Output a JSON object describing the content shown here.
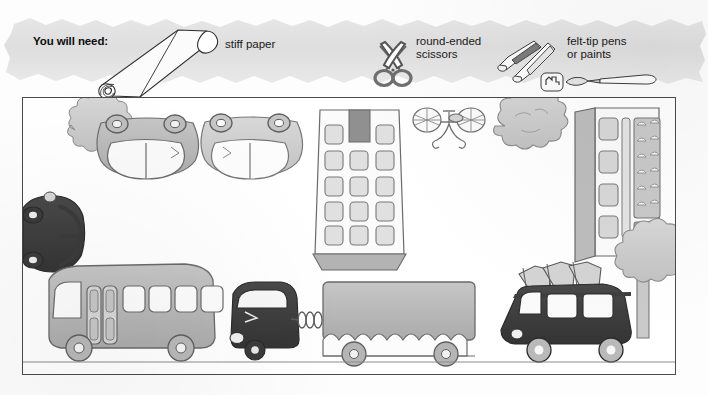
{
  "page": {
    "kind": "craft-book-scan",
    "background_color": "#ffffff"
  },
  "banner": {
    "heading": "You will need:",
    "fill_color": "#e3e3e3",
    "items": [
      {
        "label": "stiff paper",
        "icon": "paper-roll-icon"
      },
      {
        "label": "round-ended\nscissors",
        "line1": "round-ended",
        "line2": "scissors",
        "icon": "scissors-icon"
      },
      {
        "label": "felt-tip pens\nor paints",
        "line1": "felt-tip pens",
        "line2": "or paints",
        "icon": "felt-tip-pens-icon"
      }
    ]
  },
  "illustration": {
    "title": "street scene with vehicles",
    "frame_color": "#4a4a4a",
    "palette": {
      "light_gray": "#cfcfcf",
      "mid_gray": "#b5b5b5",
      "dark_gray": "#8f8f8f",
      "near_black": "#3a3a3a",
      "outline": "#555555",
      "white": "#ffffff"
    },
    "objects": [
      {
        "name": "tree-top-left",
        "type": "tree-from-above",
        "shade": "light_gray"
      },
      {
        "name": "car-top-view-1",
        "type": "car-from-above",
        "shade": "mid_gray"
      },
      {
        "name": "car-top-view-2",
        "type": "car-from-above",
        "shade": "light_gray"
      },
      {
        "name": "apartment-block",
        "type": "building-from-above",
        "shade": "light_gray"
      },
      {
        "name": "bicycle",
        "type": "bicycle-from-above",
        "shade": "white"
      },
      {
        "name": "tree-top-right",
        "type": "tree-from-above",
        "shade": "light_gray"
      },
      {
        "name": "shop-building",
        "type": "building-from-above",
        "shade": "light_gray"
      },
      {
        "name": "dark-car-left",
        "type": "car-from-above",
        "shade": "near_black"
      },
      {
        "name": "bus",
        "type": "bus-side-view",
        "shade": "mid_gray"
      },
      {
        "name": "truck-cab",
        "type": "truck-side-view",
        "shade": "near_black"
      },
      {
        "name": "trailer",
        "type": "trailer-side-view",
        "shade": "mid_gray"
      },
      {
        "name": "van-with-luggage",
        "type": "van-side-view",
        "shade": "near_black"
      },
      {
        "name": "tree-bottom-right",
        "type": "tree-side-view",
        "shade": "light_gray"
      }
    ]
  }
}
